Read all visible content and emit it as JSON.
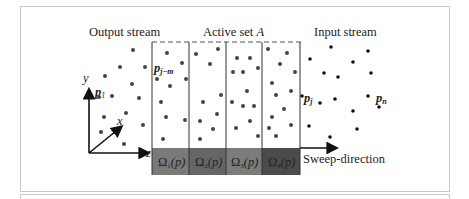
{
  "labels": {
    "output_stream": "Output stream",
    "active_set": "Active set ",
    "active_set_var": "A",
    "input_stream": "Input stream",
    "sweep_direction": "Sweep-direction",
    "p1": "p",
    "p1_sub": "1",
    "pjm": "p",
    "pjm_sub": "j−m",
    "pj": "p",
    "pj_sub": "j",
    "pn": "p",
    "pn_sub": "n",
    "axis_x": "x",
    "axis_y": "y",
    "axis_z": "z"
  },
  "cells": [
    {
      "label": "Ω",
      "sub": "1",
      "arg": "(p)",
      "color": "#7a7a7a"
    },
    {
      "label": "Ω",
      "sub": "2",
      "arg": "(p)",
      "color": "#666666"
    },
    {
      "label": "Ω",
      "sub": "3",
      "arg": "(p)",
      "color": "#7c7c7c"
    },
    {
      "label": "Ω",
      "sub": "4",
      "arg": "(p)",
      "color": "#4b4b4b"
    }
  ],
  "colors": {
    "dot": "#333333",
    "frame": "#c8c8c8",
    "line": "#333333"
  }
}
